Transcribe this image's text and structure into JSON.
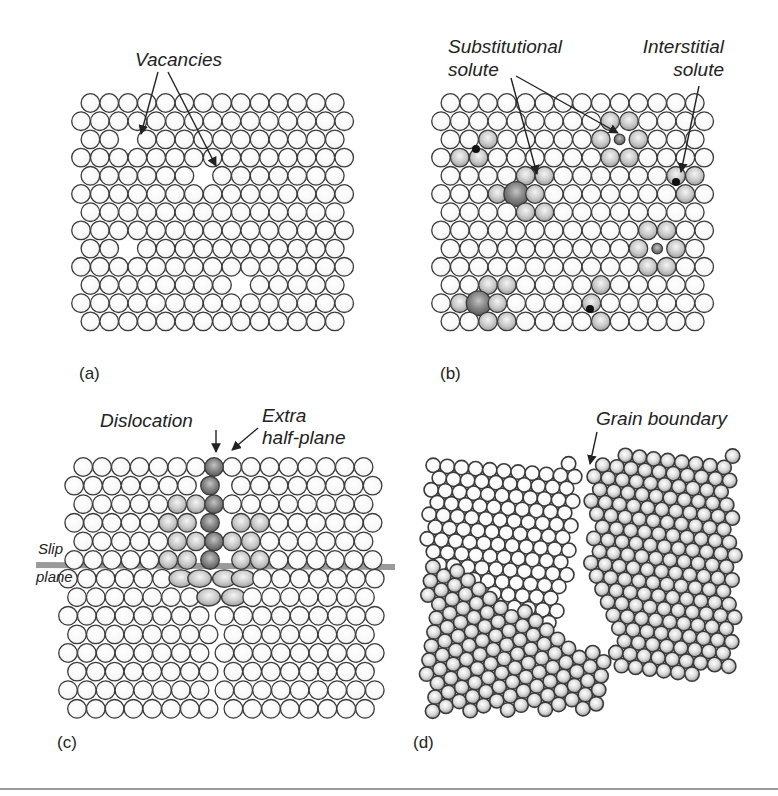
{
  "figure": {
    "panels": [
      {
        "id": "a",
        "tag": "(a)",
        "title": "Vacancies",
        "annotations": [
          {
            "text": "Vacancies",
            "role": "defect-label"
          }
        ]
      },
      {
        "id": "b",
        "tag": "(b)",
        "annotations": [
          {
            "line1": "Substitutional",
            "line2": "solute",
            "role": "defect-label"
          },
          {
            "line1": "Interstitial",
            "line2": "solute",
            "role": "defect-label"
          }
        ]
      },
      {
        "id": "c",
        "tag": "(c)",
        "annotations": [
          {
            "text": "Dislocation",
            "role": "defect-label"
          },
          {
            "line1": "Extra",
            "line2": "half-plane",
            "role": "defect-label"
          },
          {
            "line1": "Slip",
            "line2": "plane",
            "role": "defect-label"
          }
        ]
      },
      {
        "id": "d",
        "tag": "(d)",
        "annotations": [
          {
            "text": "Grain boundary",
            "role": "defect-label"
          }
        ]
      }
    ],
    "colors": {
      "atom_fill": "#ffffff",
      "atom_stroke": "#3a3a3a",
      "solute_fill": "#9a9a9a",
      "slip_plane": "#9a9a9a",
      "text": "#222222",
      "rule": "#9a9a9a"
    }
  }
}
